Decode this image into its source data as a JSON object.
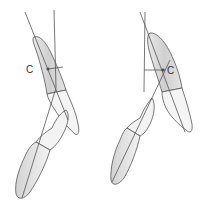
{
  "diagram": {
    "type": "dental-tooth-axis-illustration",
    "panels": [
      {
        "id": "left",
        "label": "C",
        "description": "Upper canine over lower tooth with axis lines and perpendicular to center point C"
      },
      {
        "id": "right",
        "label": "C",
        "description": "Upper canine over lower tooth with axis lines and perpendicular to center point C"
      }
    ],
    "colors": {
      "line": "#555555",
      "crown_fill": "#d9d9d9",
      "root_fill": "#f4f4f4",
      "background": "#ffffff"
    }
  }
}
